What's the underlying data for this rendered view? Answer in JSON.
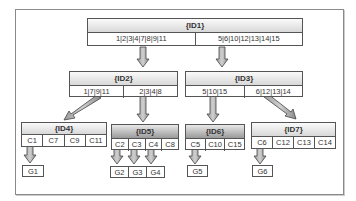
{
  "diagram": {
    "type": "tree",
    "nodes": {
      "id1": {
        "label": "{ID1}",
        "groups": [
          "1|2|3|4|7|8|9|11",
          "5|6|10|12|13|14|15"
        ]
      },
      "id2": {
        "label": "{ID2}",
        "groups": [
          "1|7|9|11",
          "2|3|4|8"
        ]
      },
      "id3": {
        "label": "{ID3}",
        "groups": [
          "5|10|15",
          "6|12|13|14"
        ]
      },
      "id4": {
        "label": "{ID4}",
        "cells": [
          "C1",
          "C7",
          "C9",
          "C11"
        ]
      },
      "id5": {
        "label": "{ID5}",
        "cells": [
          "C2",
          "C3",
          "C4",
          "C8"
        ]
      },
      "id6": {
        "label": "{ID6}",
        "cells": [
          "C5",
          "C10",
          "C15"
        ]
      },
      "id7": {
        "label": "{ID7}",
        "cells": [
          "C6",
          "C12",
          "C13",
          "C14"
        ]
      }
    },
    "leaves": [
      "G1",
      "G2",
      "G3",
      "G4",
      "G5",
      "G6"
    ],
    "edges": [
      [
        "ID1.group0",
        "ID2"
      ],
      [
        "ID1.group1",
        "ID3"
      ],
      [
        "ID2.group0",
        "ID4"
      ],
      [
        "ID2.group1",
        "ID5"
      ],
      [
        "ID3.group0",
        "ID6"
      ],
      [
        "ID3.group1",
        "ID7"
      ],
      [
        "C1",
        "G1"
      ],
      [
        "C2",
        "G2"
      ],
      [
        "C3",
        "G3"
      ],
      [
        "C4",
        "G4"
      ],
      [
        "C5",
        "G5"
      ],
      [
        "C6",
        "G6"
      ]
    ]
  }
}
